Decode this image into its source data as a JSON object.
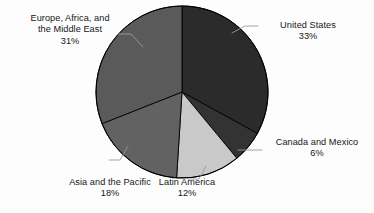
{
  "chart_data": {
    "type": "pie",
    "title": "",
    "subtitle": "",
    "xlabel": "",
    "ylabel": "",
    "legend_position": "none",
    "grid": false,
    "start_angle_deg": 0,
    "direction": "clockwise",
    "units": "percent",
    "categories": [
      "United States",
      "Canada and Mexico",
      "Latin America",
      "Asia and the Pacific",
      "Europe, Africa, and the Middle East"
    ],
    "values": [
      33,
      6,
      12,
      18,
      31
    ],
    "value_labels": [
      "33%",
      "6%",
      "12%",
      "18%",
      "31%"
    ],
    "total": 100,
    "slices": [
      {
        "name": "United States",
        "label_line1": "United States",
        "label_line2": "33%",
        "value": 33,
        "color": "#2b2b2b",
        "start_deg": 0,
        "end_deg": 118.8
      },
      {
        "name": "Canada and Mexico",
        "label_line1": "Canada and Mexico",
        "label_line2": "6%",
        "value": 6,
        "color": "#333333",
        "start_deg": 118.8,
        "end_deg": 140.4
      },
      {
        "name": "Latin America",
        "label_line1": "Latin America",
        "label_line2": "12%",
        "value": 12,
        "color": "#c9c9c9",
        "start_deg": 140.4,
        "end_deg": 183.6
      },
      {
        "name": "Asia and the Pacific",
        "label_line1": "Asia and the Pacific",
        "label_line2": "18%",
        "value": 18,
        "color": "#626262",
        "start_deg": 183.6,
        "end_deg": 248.4
      },
      {
        "name": "Europe, Africa, and the Middle East",
        "label_line1": "Europe, Africa, and",
        "label_line2": "the Middle East",
        "label_line3": "31%",
        "value": 31,
        "color": "#5a5a5a",
        "start_deg": 248.4,
        "end_deg": 360
      }
    ],
    "colors": {
      "background": "#fdfdfd",
      "slice_outline": "#000000",
      "leader_line": "#9a9a9a",
      "text": "#161616"
    }
  }
}
